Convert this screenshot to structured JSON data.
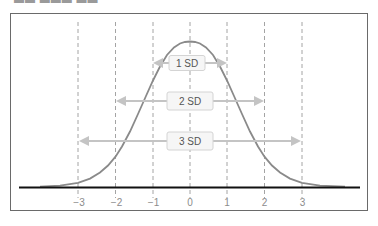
{
  "header": {
    "cutoff_text": "▬▬ ▬▬▬   ▬▬"
  },
  "diagram": {
    "colors": {
      "curve": "#8a8a8a",
      "axis": "#111111",
      "dashed_lines": "#9a9a9a",
      "arrows": "#c4c4c4",
      "label_box_fill": "#f6f6f6",
      "label_box_stroke": "#d4d4d4",
      "label_text": "#555555",
      "tick_text": "#8c8c8c",
      "frame": "#6a6a6a"
    },
    "ranges": [
      {
        "label": "1 SD",
        "from": -1,
        "to": 1
      },
      {
        "label": "2 SD",
        "from": -2,
        "to": 2
      },
      {
        "label": "3 SD",
        "from": -3,
        "to": 3
      }
    ],
    "ticks": [
      "−3",
      "−2",
      "−1",
      "0",
      "1",
      "2",
      "3"
    ]
  }
}
